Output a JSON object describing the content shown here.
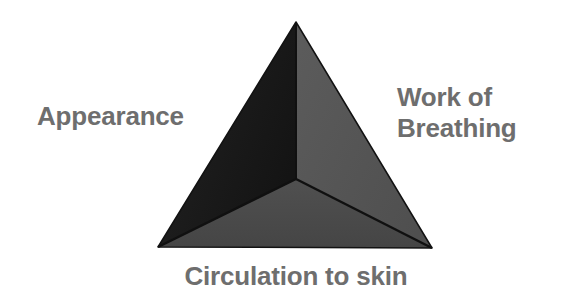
{
  "diagram": {
    "name": "pediatric-assessment-triangle",
    "background_color": "#ffffff",
    "label_color": "#6e6e6e",
    "labels": {
      "appearance": "Appearance",
      "work_of_breathing_line1": "Work of",
      "work_of_breathing_line2": "Breathing",
      "circulation": "Circulation to skin"
    },
    "faces": [
      {
        "name": "left-face-appearance",
        "fill": "#1b1b1b",
        "points": "296,22 296,179 158,247"
      },
      {
        "name": "right-face-work-of-breathing",
        "fill": "#565656",
        "points": "296,22 432,248 296,179"
      },
      {
        "name": "bottom-face-circulation",
        "fill": "#4b4b4b",
        "points": "158,247 296,179 432,248"
      }
    ],
    "edges": {
      "color": "#151515",
      "width": 2,
      "vertical_edge": "296,22 296,179",
      "left_edge": "296,179 158,247",
      "right_edge": "296,179 432,248"
    },
    "vertices": {
      "apex": "296,22",
      "bottom_left": "158,247",
      "bottom_right": "432,248",
      "center": "296,179"
    }
  }
}
